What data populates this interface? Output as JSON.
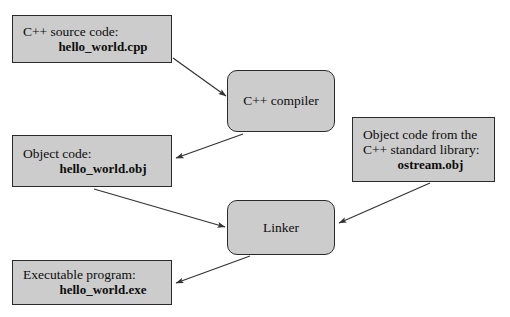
{
  "diagram": {
    "background_color": "#ffffff",
    "node_fill": "#cccccc",
    "node_border": "#2b2b2b",
    "arrow_color": "#333333",
    "nodes": [
      {
        "id": "source",
        "shape": "rectangle",
        "label_line1": "C++ source code:",
        "filename": "hello_world.cpp"
      },
      {
        "id": "compiler",
        "shape": "rounded",
        "label": "C++ compiler"
      },
      {
        "id": "object",
        "shape": "rectangle",
        "label_line1": "Object code:",
        "filename": "hello_world.obj"
      },
      {
        "id": "stdlib",
        "shape": "rectangle",
        "label_line1": "Object code from the",
        "label_line2": "C++ standard library:",
        "filename": "ostream.obj"
      },
      {
        "id": "linker",
        "shape": "rounded",
        "label": "Linker"
      },
      {
        "id": "executable",
        "shape": "rectangle",
        "label_line1": "Executable program:",
        "filename": "hello_world.exe"
      }
    ],
    "edges": [
      {
        "id": "source-to-compiler",
        "from": "source",
        "to": "compiler"
      },
      {
        "id": "compiler-to-object",
        "from": "compiler",
        "to": "object"
      },
      {
        "id": "object-to-linker",
        "from": "object",
        "to": "linker"
      },
      {
        "id": "stdlib-to-linker",
        "from": "stdlib",
        "to": "linker"
      },
      {
        "id": "linker-to-executable",
        "from": "linker",
        "to": "executable"
      }
    ]
  }
}
